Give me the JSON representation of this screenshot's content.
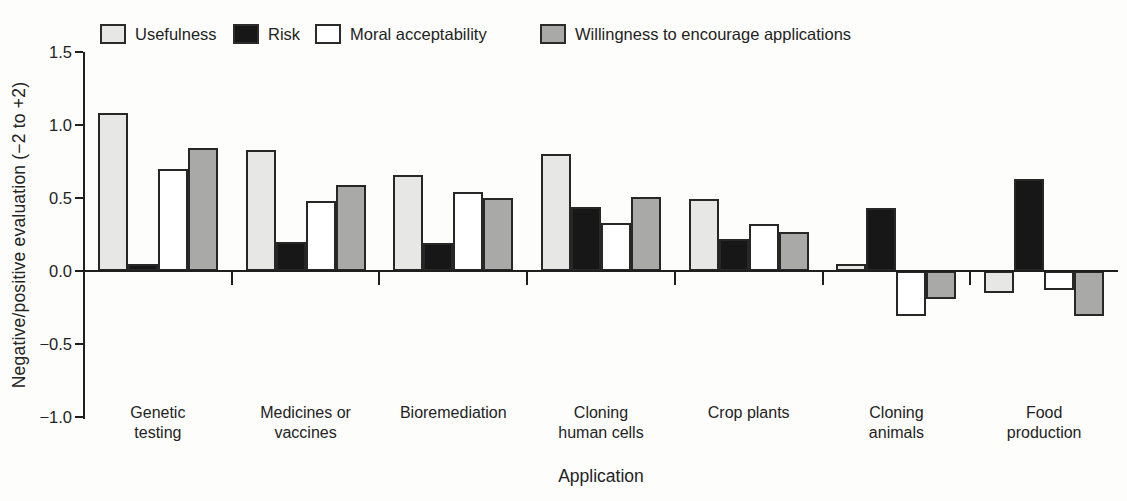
{
  "figure": {
    "background": "#fdfdfb",
    "ink_color": "#232323"
  },
  "chart_data": {
    "type": "bar",
    "title": "",
    "xlabel": "Application",
    "ylabel": "Negative/positive evaluation (−2 to +2)",
    "ylim": [
      -1.0,
      1.5
    ],
    "yticks": [
      1.5,
      1.0,
      0.5,
      0.0,
      -0.5,
      -1.0
    ],
    "ytick_labels": [
      "1.5",
      "1.0",
      "0.5",
      "0.0",
      "−0.5",
      "−1.0"
    ],
    "grid": false,
    "legend_position": "top",
    "categories": [
      "Genetic\ntesting",
      "Medicines or\nvaccines",
      "Bioremediation",
      "Cloning\nhuman cells",
      "Crop plants",
      "Cloning\nanimals",
      "Food\nproduction"
    ],
    "series": [
      {
        "name": "Usefulness",
        "color": "#e7e7e5",
        "values": [
          1.08,
          0.83,
          0.66,
          0.8,
          0.49,
          0.05,
          -0.15
        ]
      },
      {
        "name": "Risk",
        "color": "#171717",
        "values": [
          0.05,
          0.2,
          0.19,
          0.44,
          0.22,
          0.43,
          0.63
        ]
      },
      {
        "name": "Moral acceptability",
        "color": "#ffffff",
        "values": [
          0.7,
          0.48,
          0.54,
          0.33,
          0.32,
          -0.31,
          -0.13
        ]
      },
      {
        "name": "Willingness to encourage applications",
        "color": "#a9a9a7",
        "values": [
          0.84,
          0.59,
          0.5,
          0.51,
          0.27,
          -0.19,
          -0.31
        ]
      }
    ]
  }
}
